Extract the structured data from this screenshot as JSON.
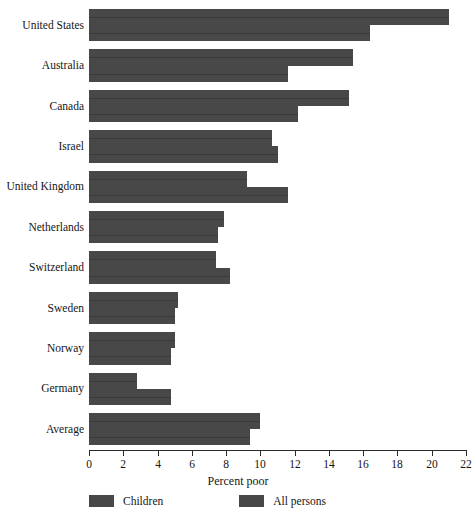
{
  "chart_data": {
    "type": "bar",
    "orientation": "horizontal",
    "title": "",
    "xlabel": "Percent poor",
    "ylabel": "",
    "xlim": [
      0,
      22
    ],
    "xticks": [
      0,
      2,
      4,
      6,
      8,
      10,
      12,
      14,
      16,
      18,
      20,
      22
    ],
    "xtick_labels": [
      "0",
      "2",
      "4",
      "6",
      "8",
      "10",
      "12",
      "14",
      "16",
      "18",
      "20",
      "22"
    ],
    "grid": false,
    "legend_position": "bottom-left",
    "categories": [
      "United States",
      "Australia",
      "Canada",
      "Israel",
      "United Kingdom",
      "Netherlands",
      "Switzerland",
      "Sweden",
      "Norway",
      "Germany",
      "Average"
    ],
    "series": [
      {
        "name": "Children",
        "color": "#484848",
        "values": [
          21.0,
          15.4,
          15.2,
          10.7,
          9.2,
          7.9,
          7.4,
          5.2,
          5.0,
          2.8,
          10.0
        ]
      },
      {
        "name": "All persons",
        "color": "#484848",
        "values": [
          16.4,
          11.6,
          12.2,
          11.0,
          11.6,
          7.5,
          8.2,
          5.0,
          4.8,
          4.8,
          9.4
        ]
      }
    ]
  },
  "legend": {
    "items": [
      {
        "label": "Children"
      },
      {
        "label": "All persons"
      }
    ]
  },
  "colors": {
    "bar": "#484848",
    "axis": "#2a2a2a",
    "text": "#151515",
    "background": "#ffffff"
  }
}
